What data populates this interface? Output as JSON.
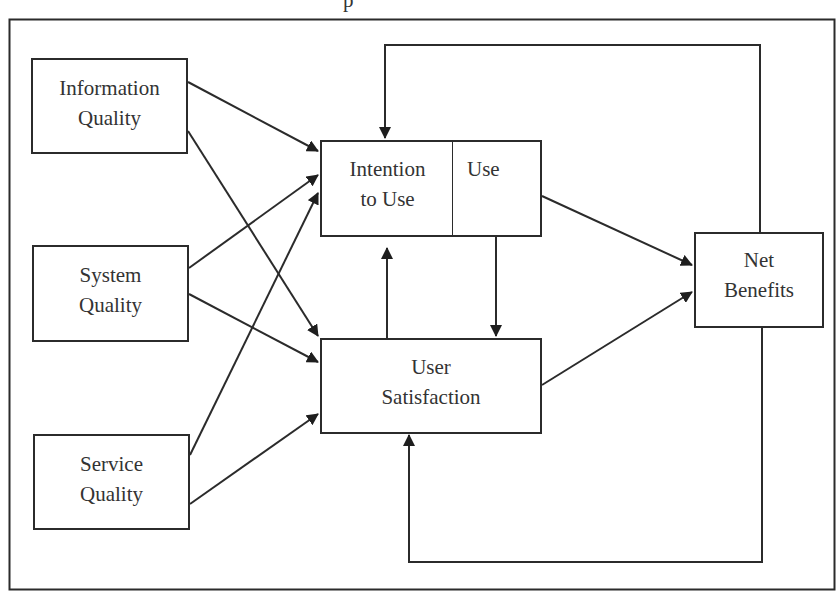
{
  "diagram": {
    "title_fragment": "p",
    "nodes": {
      "information_quality": {
        "line1": "Information",
        "line2": "Quality"
      },
      "system_quality": {
        "line1": "System",
        "line2": "Quality"
      },
      "service_quality": {
        "line1": "Service",
        "line2": "Quality"
      },
      "intention_to_use": {
        "line1": "Intention",
        "line2": "to Use"
      },
      "use": {
        "line1": "Use"
      },
      "user_satisfaction": {
        "line1": "User",
        "line2": "Satisfaction"
      },
      "net_benefits": {
        "line1": "Net",
        "line2": "Benefits"
      }
    },
    "edges": [
      {
        "from": "Information Quality",
        "to": "Intention to Use"
      },
      {
        "from": "Information Quality",
        "to": "User Satisfaction"
      },
      {
        "from": "System Quality",
        "to": "Intention to Use"
      },
      {
        "from": "System Quality",
        "to": "User Satisfaction"
      },
      {
        "from": "Service Quality",
        "to": "Intention to Use"
      },
      {
        "from": "Service Quality",
        "to": "User Satisfaction"
      },
      {
        "from": "Use",
        "to": "Net Benefits"
      },
      {
        "from": "User Satisfaction",
        "to": "Net Benefits"
      },
      {
        "from": "User Satisfaction",
        "to": "Intention to Use"
      },
      {
        "from": "Use",
        "to": "User Satisfaction"
      },
      {
        "from": "Net Benefits",
        "to": "Intention to Use",
        "type": "feedback"
      },
      {
        "from": "Net Benefits",
        "to": "User Satisfaction",
        "type": "feedback"
      }
    ],
    "colors": {
      "line": "#2b2b2b",
      "text": "#333333",
      "background": "#ffffff"
    }
  }
}
